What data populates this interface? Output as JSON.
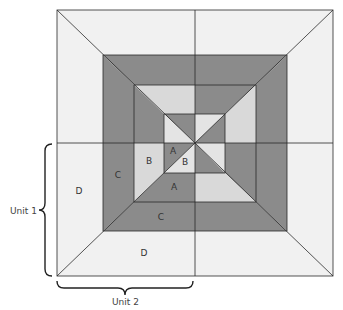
{
  "diagram": {
    "colors": {
      "outer_light": "#f1f1f1",
      "dark": "#8b8b8b",
      "ring_light": "#d9d9d9",
      "inner_light": "#e4e4e4",
      "line": "#2a2a2a"
    },
    "squares": {
      "outer": {
        "l": 57,
        "t": 10,
        "r": 333,
        "b": 276
      },
      "dark": {
        "l": 103,
        "t": 55,
        "r": 287,
        "b": 231
      },
      "third": {
        "l": 134,
        "t": 85,
        "r": 256,
        "b": 202
      },
      "inner": {
        "l": 164,
        "t": 114,
        "r": 225,
        "b": 173
      }
    },
    "center": {
      "x": 195,
      "y": 143
    },
    "regions": [
      {
        "quadrant": "top-left",
        "pts": "57,10 195,10 195,55 103,55",
        "fill": "outer_light"
      },
      {
        "quadrant": "top-left",
        "pts": "57,10 103,55 103,143 57,143",
        "fill": "outer_light"
      },
      {
        "quadrant": "top-left",
        "pts": "103,55 195,55 195,85 134,85",
        "fill": "dark"
      },
      {
        "quadrant": "top-left",
        "pts": "103,55 134,85 134,143 103,143",
        "fill": "dark"
      },
      {
        "quadrant": "top-left",
        "pts": "134,85 195,85 195,114 164,114",
        "fill": "ring_light"
      },
      {
        "quadrant": "top-left",
        "pts": "134,85 164,114 164,143 134,143",
        "fill": "dark"
      },
      {
        "quadrant": "top-left",
        "pts": "164,114 195,114 195,143",
        "fill": "dark"
      },
      {
        "quadrant": "top-left",
        "pts": "164,114 195,143 164,143",
        "fill": "inner_light"
      },
      {
        "quadrant": "top-right",
        "pts": "195,10 333,10 287,55 195,55",
        "fill": "outer_light"
      },
      {
        "quadrant": "top-right",
        "pts": "333,10 333,143 287,143 287,55",
        "fill": "outer_light"
      },
      {
        "quadrant": "top-right",
        "pts": "195,55 287,55 256,85 195,85",
        "fill": "dark"
      },
      {
        "quadrant": "top-right",
        "pts": "287,55 287,143 256,143 256,85",
        "fill": "dark"
      },
      {
        "quadrant": "top-right",
        "pts": "195,85 256,85 225,114 195,114",
        "fill": "dark"
      },
      {
        "quadrant": "top-right",
        "pts": "256,85 256,143 225,143 225,114",
        "fill": "ring_light"
      },
      {
        "quadrant": "top-right",
        "pts": "195,114 225,114 195,143",
        "fill": "inner_light"
      },
      {
        "quadrant": "top-right",
        "pts": "225,114 225,143 195,143",
        "fill": "dark"
      },
      {
        "quadrant": "bottom-left",
        "pts": "57,143 103,143 103,231 57,276",
        "fill": "outer_light"
      },
      {
        "quadrant": "bottom-left",
        "pts": "57,276 103,231 195,231 195,276",
        "fill": "outer_light"
      },
      {
        "quadrant": "bottom-left",
        "pts": "103,143 134,143 134,202 103,231",
        "fill": "dark"
      },
      {
        "quadrant": "bottom-left",
        "pts": "103,231 134,202 195,202 195,231",
        "fill": "dark"
      },
      {
        "quadrant": "bottom-left",
        "pts": "134,143 164,143 164,173 134,202",
        "fill": "ring_light"
      },
      {
        "quadrant": "bottom-left",
        "pts": "134,202 164,173 195,173 195,202",
        "fill": "dark"
      },
      {
        "quadrant": "bottom-left",
        "pts": "164,143 195,143 164,173",
        "fill": "dark"
      },
      {
        "quadrant": "bottom-left",
        "pts": "164,173 195,143 195,173",
        "fill": "inner_light"
      },
      {
        "quadrant": "bottom-right",
        "pts": "287,143 333,143 333,276 287,231",
        "fill": "outer_light"
      },
      {
        "quadrant": "bottom-right",
        "pts": "195,231 287,231 333,276 195,276",
        "fill": "outer_light"
      },
      {
        "quadrant": "bottom-right",
        "pts": "256,143 287,143 287,231 256,202",
        "fill": "dark"
      },
      {
        "quadrant": "bottom-right",
        "pts": "195,202 256,202 287,231 195,231",
        "fill": "dark"
      },
      {
        "quadrant": "bottom-right",
        "pts": "225,143 256,143 256,202 225,173",
        "fill": "dark"
      },
      {
        "quadrant": "bottom-right",
        "pts": "195,173 225,173 256,202 195,202",
        "fill": "ring_light"
      },
      {
        "quadrant": "bottom-right",
        "pts": "195,143 225,143 225,173",
        "fill": "inner_light"
      },
      {
        "quadrant": "bottom-right",
        "pts": "195,143 225,173 195,173",
        "fill": "dark"
      }
    ],
    "labels": [
      {
        "text": "D",
        "x": 79,
        "y": 194
      },
      {
        "text": "C",
        "x": 118,
        "y": 178
      },
      {
        "text": "B",
        "x": 149,
        "y": 164
      },
      {
        "text": "A",
        "x": 173,
        "y": 154
      },
      {
        "text": "B",
        "x": 185,
        "y": 165
      },
      {
        "text": "A",
        "x": 174,
        "y": 190
      },
      {
        "text": "C",
        "x": 161,
        "y": 220
      },
      {
        "text": "D",
        "x": 144,
        "y": 256
      }
    ],
    "unit1": {
      "label": "Unit 1"
    },
    "unit2": {
      "label": "Unit 2"
    }
  }
}
